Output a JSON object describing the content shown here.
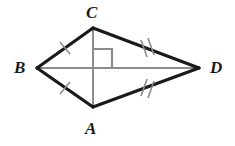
{
  "figure": {
    "type": "geometry-diagram",
    "shape": "kite",
    "title": "",
    "background_color": "#ffffff",
    "edge_color": "#1a1a1a",
    "edge_width": 3,
    "diagonal_color": "#8c8c8c",
    "diagonal_width": 2,
    "tick_color": "#8c8c8c",
    "tick_width": 1.4,
    "right_angle_color": "#8c8c8c",
    "vertices": [
      {
        "name": "C",
        "label": "C",
        "x": 93,
        "y": 28,
        "position": "top"
      },
      {
        "name": "B",
        "label": "B",
        "x": 37,
        "y": 68,
        "position": "left"
      },
      {
        "name": "D",
        "label": "D",
        "x": 199,
        "y": 68,
        "position": "right"
      },
      {
        "name": "A",
        "label": "A",
        "x": 93,
        "y": 107,
        "position": "bottom"
      }
    ],
    "edges": [
      {
        "name": "BC",
        "from": "B",
        "to": "C",
        "ticks": 1
      },
      {
        "name": "CD",
        "from": "C",
        "to": "D",
        "ticks": 2
      },
      {
        "name": "AD",
        "from": "A",
        "to": "D",
        "ticks": 2
      },
      {
        "name": "AB",
        "from": "A",
        "to": "B",
        "ticks": 1
      }
    ],
    "diagonals": [
      {
        "name": "BD",
        "from": "B",
        "to": "D"
      },
      {
        "name": "CA",
        "from": "C",
        "to": "A"
      }
    ],
    "right_angle": {
      "at": "intersection-of-diagonals",
      "x": 93,
      "y": 68,
      "quadrant": "upper-right",
      "size": 19
    }
  }
}
